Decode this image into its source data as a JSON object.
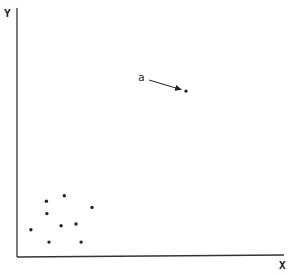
{
  "chart_data": {
    "type": "scatter",
    "title": "",
    "xlabel": "X",
    "ylabel": "Y",
    "xlim": [
      0,
      100
    ],
    "ylim": [
      0,
      100
    ],
    "grid": false,
    "legend": null,
    "ticks": false,
    "series": [
      {
        "name": "points",
        "x": [
          5.2,
          11.0,
          11.2,
          12.0,
          16.5,
          17.7,
          22.1,
          24.0,
          28.1,
          63.3
        ],
        "y": [
          10.6,
          22.1,
          17.1,
          5.6,
          12.2,
          24.3,
          12.9,
          5.6,
          19.6,
          66.5
        ]
      }
    ],
    "annotations": [
      {
        "text": "a",
        "point_index": 9,
        "x": 63.3,
        "y": 66.5,
        "arrow": true,
        "note": "outlier"
      }
    ]
  },
  "labels": {
    "x_axis": "X",
    "y_axis": "Y",
    "annotation": "a"
  },
  "style": {
    "ink": "#222222",
    "background": "#ffffff"
  }
}
